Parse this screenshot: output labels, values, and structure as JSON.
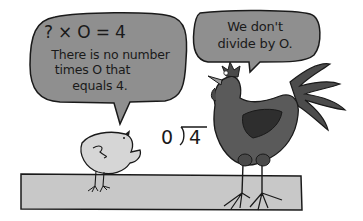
{
  "bubble_left": {
    "equation": "? × O = 4",
    "lines": [
      "There is no number",
      "times O that",
      "equals 4."
    ]
  },
  "bubble_right": {
    "lines": [
      "We don't",
      "divide by O."
    ]
  },
  "division": {
    "divisor": "0",
    "dividend": "4"
  },
  "colors": {
    "bubble_fill": "#8f8f8f",
    "ground_fill": "#c8c8c8",
    "rooster_body": "#5a5a5a",
    "chick_fill": "#d6d6d6",
    "outline": "#1a1a1a"
  }
}
